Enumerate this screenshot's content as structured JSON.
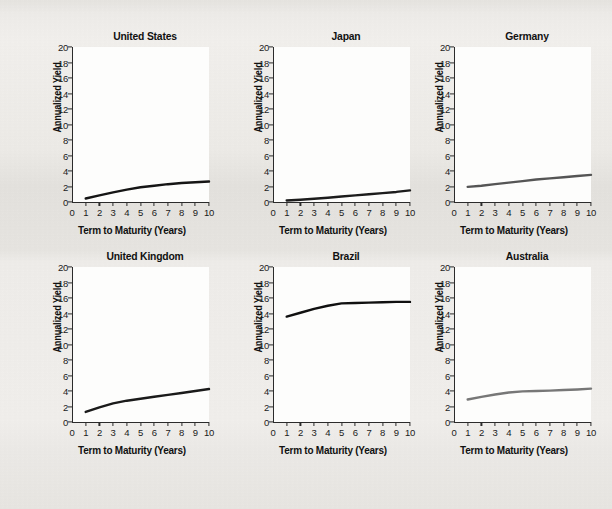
{
  "chart_data": {
    "type": "line",
    "title": "",
    "xlabel": "Term to Maturity (Years)",
    "ylabel": "Annualized Yield",
    "xlim": [
      0,
      10
    ],
    "ylim": [
      0,
      20
    ],
    "xticks": [
      0,
      1,
      2,
      3,
      4,
      5,
      6,
      7,
      8,
      9,
      10
    ],
    "yticks": [
      0,
      2,
      4,
      6,
      8,
      10,
      12,
      14,
      16,
      18,
      20
    ],
    "grid": false,
    "legend": "none",
    "x": [
      1,
      2,
      3,
      4,
      5,
      6,
      7,
      8,
      9,
      10
    ],
    "panels": [
      {
        "title": "United States",
        "color": "#151515",
        "values": [
          0.45,
          0.85,
          1.25,
          1.6,
          1.9,
          2.1,
          2.3,
          2.45,
          2.55,
          2.65
        ]
      },
      {
        "title": "Japan",
        "color": "#1c1c1c",
        "values": [
          0.2,
          0.3,
          0.42,
          0.55,
          0.7,
          0.85,
          1.0,
          1.15,
          1.3,
          1.5
        ]
      },
      {
        "title": "Germany",
        "color": "#555555",
        "values": [
          1.95,
          2.1,
          2.3,
          2.5,
          2.7,
          2.9,
          3.05,
          3.2,
          3.35,
          3.5
        ]
      },
      {
        "title": "United Kingdom",
        "color": "#1a1a1a",
        "values": [
          1.3,
          1.9,
          2.4,
          2.75,
          3.0,
          3.25,
          3.5,
          3.75,
          4.0,
          4.25
        ]
      },
      {
        "title": "Brazil",
        "color": "#101010",
        "values": [
          13.6,
          14.1,
          14.6,
          15.0,
          15.3,
          15.35,
          15.4,
          15.45,
          15.5,
          15.5
        ]
      },
      {
        "title": "Australia",
        "color": "#777777",
        "values": [
          2.9,
          3.25,
          3.55,
          3.8,
          3.95,
          4.0,
          4.05,
          4.12,
          4.2,
          4.3
        ]
      }
    ]
  }
}
